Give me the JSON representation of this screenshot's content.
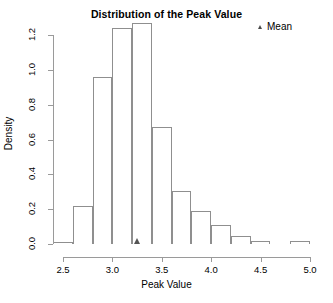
{
  "chart_data": {
    "type": "bar",
    "title": "Distribution of the Peak Value",
    "xlabel": "Peak Value",
    "ylabel": "Density",
    "grid": false,
    "legend_position": "top-right",
    "legend": [
      {
        "label": "Mean",
        "marker": "triangle",
        "color": "#4a4a4a"
      }
    ],
    "xlim": [
      2.4,
      5.0
    ],
    "ylim": [
      0.0,
      1.3
    ],
    "xticks": [
      2.5,
      3.0,
      3.5,
      4.0,
      4.5,
      5.0
    ],
    "xtick_labels": [
      "2.5",
      "3.0",
      "3.5",
      "4.0",
      "4.5",
      "5.0"
    ],
    "yticks": [
      0.0,
      0.2,
      0.4,
      0.6,
      0.8,
      1.0,
      1.2
    ],
    "ytick_labels": [
      "0.0",
      "0.2",
      "0.4",
      "0.6",
      "0.8",
      "1.0",
      "1.2"
    ],
    "bin_width": 0.2,
    "bin_edges": [
      2.4,
      2.6,
      2.8,
      3.0,
      3.2,
      3.4,
      3.6,
      3.8,
      4.0,
      4.2,
      4.4,
      4.6,
      4.8,
      5.0
    ],
    "categories": [
      "2.4-2.6",
      "2.6-2.8",
      "2.8-3.0",
      "3.0-3.2",
      "3.2-3.4",
      "3.4-3.6",
      "3.6-3.8",
      "3.8-4.0",
      "4.0-4.2",
      "4.2-4.4",
      "4.4-4.6",
      "4.6-4.8",
      "4.8-5.0"
    ],
    "values": [
      0.01,
      0.22,
      0.96,
      1.24,
      1.27,
      0.67,
      0.305,
      0.19,
      0.11,
      0.045,
      0.02,
      0.0,
      0.015
    ],
    "annotations": [
      {
        "name": "mean",
        "x": 3.25,
        "y": 0.0,
        "marker": "triangle",
        "color": "#555555"
      }
    ]
  },
  "title_text": "Distribution of the Peak Value",
  "legend_text": "Mean"
}
